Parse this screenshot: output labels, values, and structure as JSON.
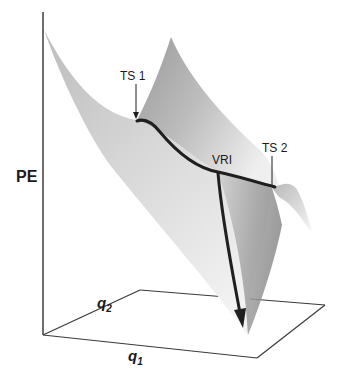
{
  "diagram": {
    "type": "potential-energy-surface",
    "axes": {
      "vertical": {
        "label": "PE"
      },
      "q1": {
        "label": "q",
        "subscript": "1"
      },
      "q2": {
        "label": "q",
        "subscript": "2"
      }
    },
    "points": [
      {
        "id": "ts1",
        "label": "TS 1"
      },
      {
        "id": "vri",
        "label": "VRI"
      },
      {
        "id": "ts2",
        "label": "TS 2"
      }
    ],
    "colors": {
      "surface_light": "#e6e6e6",
      "surface_dark": "#8c8c8c",
      "path": "#1f1f1f",
      "axis": "#3a3a3a",
      "background": "#ffffff"
    }
  }
}
